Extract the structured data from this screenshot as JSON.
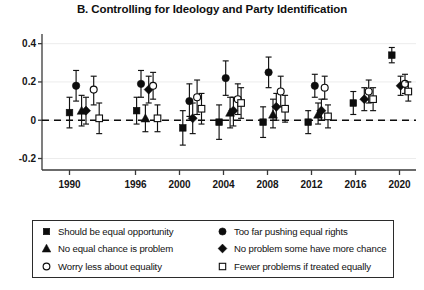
{
  "chart_data": {
    "type": "scatter",
    "title": "B. Controlling for Ideology and Party Identification",
    "xlabel": "",
    "ylabel": "",
    "ylim": [
      -0.26,
      0.44
    ],
    "yticks": [
      0.4,
      0.2,
      0,
      -0.2
    ],
    "ytick_labels": [
      "0.4",
      "0.2",
      "0",
      "-0.2"
    ],
    "xlim": [
      1987.5,
      2021.5
    ],
    "xticks": [
      1990,
      1996,
      2000,
      2004,
      2008,
      2012,
      2016,
      2020
    ],
    "xtick_labels": [
      "1990",
      "1996",
      "2000",
      "2004",
      "2008",
      "2012",
      "2016",
      "2020"
    ],
    "grid": false,
    "zero_reference_line": {
      "value": 0,
      "style": "dashed"
    },
    "error_bars": "95% confidence intervals",
    "legend_position": "below-plot",
    "series": [
      {
        "name": "Should be equal opportunity",
        "marker": "filled-square",
        "points": [
          {
            "x": 1990.0,
            "y": 0.04,
            "lo": -0.04,
            "hi": 0.12
          },
          {
            "x": 1996.1,
            "y": 0.05,
            "lo": -0.02,
            "hi": 0.12
          },
          {
            "x": 2000.3,
            "y": -0.04,
            "lo": -0.13,
            "hi": 0.05
          },
          {
            "x": 2003.6,
            "y": -0.01,
            "lo": -0.1,
            "hi": 0.08
          },
          {
            "x": 2007.6,
            "y": -0.01,
            "lo": -0.09,
            "hi": 0.07
          },
          {
            "x": 2011.7,
            "y": -0.01,
            "lo": -0.07,
            "hi": 0.05
          },
          {
            "x": 2015.8,
            "y": 0.09,
            "lo": 0.03,
            "hi": 0.15
          },
          {
            "x": 2019.3,
            "y": 0.34,
            "lo": 0.3,
            "hi": 0.38
          }
        ]
      },
      {
        "name": "Too far pushing equal rights",
        "marker": "filled-circle",
        "points": [
          {
            "x": 1990.6,
            "y": 0.18,
            "lo": 0.1,
            "hi": 0.26
          },
          {
            "x": 1996.5,
            "y": 0.19,
            "lo": 0.12,
            "hi": 0.26
          },
          {
            "x": 2000.9,
            "y": 0.1,
            "lo": 0.02,
            "hi": 0.19
          },
          {
            "x": 2004.2,
            "y": 0.22,
            "lo": 0.13,
            "hi": 0.31
          },
          {
            "x": 2008.1,
            "y": 0.25,
            "lo": 0.17,
            "hi": 0.33
          },
          {
            "x": 2012.3,
            "y": 0.18,
            "lo": 0.12,
            "hi": 0.24
          }
        ]
      },
      {
        "name": "No equal chance is problem",
        "marker": "filled-triangle",
        "points": [
          {
            "x": 1991.1,
            "y": 0.05,
            "lo": -0.03,
            "hi": 0.13
          },
          {
            "x": 1996.9,
            "y": 0.01,
            "lo": -0.06,
            "hi": 0.08
          },
          {
            "x": 2004.6,
            "y": 0.04,
            "lo": -0.04,
            "hi": 0.12
          },
          {
            "x": 2008.5,
            "y": 0.03,
            "lo": -0.04,
            "hi": 0.11
          },
          {
            "x": 2012.6,
            "y": 0.03,
            "lo": -0.02,
            "hi": 0.09
          }
        ]
      },
      {
        "name": "No problem some have more chance",
        "marker": "filled-diamond",
        "points": [
          {
            "x": 1991.5,
            "y": 0.05,
            "lo": -0.02,
            "hi": 0.12
          },
          {
            "x": 1997.2,
            "y": 0.16,
            "lo": 0.09,
            "hi": 0.23
          },
          {
            "x": 2001.2,
            "y": 0.01,
            "lo": -0.07,
            "hi": 0.09
          },
          {
            "x": 2004.9,
            "y": 0.05,
            "lo": -0.03,
            "hi": 0.12
          },
          {
            "x": 2008.8,
            "y": 0.07,
            "lo": 0.0,
            "hi": 0.14
          },
          {
            "x": 2012.9,
            "y": 0.05,
            "lo": 0.0,
            "hi": 0.11
          },
          {
            "x": 2016.8,
            "y": 0.11,
            "lo": 0.05,
            "hi": 0.17
          },
          {
            "x": 2020.1,
            "y": 0.18,
            "lo": 0.13,
            "hi": 0.23
          }
        ]
      },
      {
        "name": "Worry less about equality",
        "marker": "open-circle",
        "points": [
          {
            "x": 1992.2,
            "y": 0.16,
            "lo": 0.08,
            "hi": 0.23
          },
          {
            "x": 1997.6,
            "y": 0.18,
            "lo": 0.11,
            "hi": 0.25
          },
          {
            "x": 2001.6,
            "y": 0.12,
            "lo": 0.03,
            "hi": 0.21
          },
          {
            "x": 2005.3,
            "y": 0.11,
            "lo": 0.03,
            "hi": 0.19
          },
          {
            "x": 2009.2,
            "y": 0.15,
            "lo": 0.07,
            "hi": 0.23
          },
          {
            "x": 2013.2,
            "y": 0.17,
            "lo": 0.11,
            "hi": 0.23
          },
          {
            "x": 2017.2,
            "y": 0.15,
            "lo": 0.09,
            "hi": 0.21
          },
          {
            "x": 2020.5,
            "y": 0.19,
            "lo": 0.14,
            "hi": 0.24
          }
        ]
      },
      {
        "name": "Fewer problems if treated equally",
        "marker": "open-square",
        "points": [
          {
            "x": 1992.7,
            "y": 0.01,
            "lo": -0.07,
            "hi": 0.09
          },
          {
            "x": 1998.0,
            "y": 0.01,
            "lo": -0.06,
            "hi": 0.08
          },
          {
            "x": 2002.0,
            "y": 0.06,
            "lo": -0.02,
            "hi": 0.14
          },
          {
            "x": 2005.6,
            "y": 0.09,
            "lo": 0.01,
            "hi": 0.17
          },
          {
            "x": 2009.6,
            "y": 0.06,
            "lo": -0.01,
            "hi": 0.13
          },
          {
            "x": 2013.5,
            "y": 0.02,
            "lo": -0.04,
            "hi": 0.08
          },
          {
            "x": 2017.6,
            "y": 0.11,
            "lo": 0.05,
            "hi": 0.17
          },
          {
            "x": 2020.8,
            "y": 0.15,
            "lo": 0.1,
            "hi": 0.2
          }
        ]
      }
    ]
  },
  "legend": {
    "entries": [
      {
        "label": "Should be equal opportunity",
        "marker": "filled-square"
      },
      {
        "label": "Too far pushing equal rights",
        "marker": "filled-circle"
      },
      {
        "label": "No equal chance is problem",
        "marker": "filled-triangle"
      },
      {
        "label": "No problem some have more chance",
        "marker": "filled-diamond"
      },
      {
        "label": "Worry less about equality",
        "marker": "open-circle"
      },
      {
        "label": "Fewer problems if treated equally",
        "marker": "open-square"
      }
    ]
  }
}
